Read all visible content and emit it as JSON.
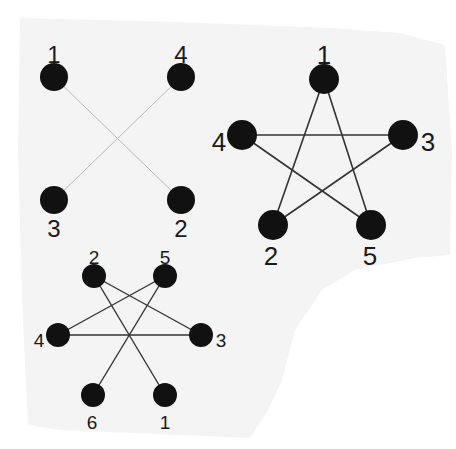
{
  "colors": {
    "background": "#ffffff",
    "paper": "#f4f4f4",
    "node": "#111111",
    "edge_dark": "#333333",
    "edge_light": "#b9b9b9",
    "label": "#1a1a1a"
  },
  "graphs": [
    {
      "id": "graph-a",
      "description": "4-node graph with crossing edges",
      "node_radius": 14,
      "label_size": 24,
      "edge_color_key": "edge_light",
      "edge_width": 1,
      "nodes": [
        {
          "id": "1",
          "label": "1",
          "x": 54,
          "y": 77,
          "lx": 54,
          "ly": 57
        },
        {
          "id": "4",
          "label": "4",
          "x": 181,
          "y": 77,
          "lx": 181,
          "ly": 57
        },
        {
          "id": "3",
          "label": "3",
          "x": 54,
          "y": 200,
          "lx": 54,
          "ly": 231
        },
        {
          "id": "2",
          "label": "2",
          "x": 181,
          "y": 200,
          "lx": 181,
          "ly": 231
        }
      ],
      "edges": [
        [
          "1",
          "2"
        ],
        [
          "4",
          "3"
        ]
      ]
    },
    {
      "id": "graph-b",
      "description": "5-node pentagram (star) graph",
      "node_radius": 15,
      "label_size": 26,
      "edge_color_key": "edge_dark",
      "edge_width": 1.6,
      "nodes": [
        {
          "id": "1",
          "label": "1",
          "x": 324,
          "y": 79,
          "lx": 324,
          "ly": 57
        },
        {
          "id": "4",
          "label": "4",
          "x": 242,
          "y": 135,
          "lx": 219,
          "ly": 144
        },
        {
          "id": "3",
          "label": "3",
          "x": 403,
          "y": 135,
          "lx": 428,
          "ly": 144
        },
        {
          "id": "2",
          "label": "2",
          "x": 273,
          "y": 225,
          "lx": 271,
          "ly": 258
        },
        {
          "id": "5",
          "label": "5",
          "x": 371,
          "y": 225,
          "lx": 370,
          "ly": 258
        }
      ],
      "edges": [
        [
          "1",
          "2"
        ],
        [
          "1",
          "5"
        ],
        [
          "4",
          "3"
        ],
        [
          "4",
          "5"
        ],
        [
          "3",
          "2"
        ]
      ]
    },
    {
      "id": "graph-c",
      "description": "6-node graph",
      "node_radius": 12,
      "label_size": 19,
      "edge_color_key": "edge_dark",
      "edge_width": 1.4,
      "nodes": [
        {
          "id": "2",
          "label": "2",
          "x": 94,
          "y": 276,
          "lx": 94,
          "ly": 259
        },
        {
          "id": "5",
          "label": "5",
          "x": 165,
          "y": 276,
          "lx": 165,
          "ly": 259
        },
        {
          "id": "4",
          "label": "4",
          "x": 58,
          "y": 335,
          "lx": 39,
          "ly": 342
        },
        {
          "id": "3",
          "label": "3",
          "x": 201,
          "y": 335,
          "lx": 221,
          "ly": 342
        },
        {
          "id": "6",
          "label": "6",
          "x": 93,
          "y": 395,
          "lx": 92,
          "ly": 424
        },
        {
          "id": "1",
          "label": "1",
          "x": 165,
          "y": 395,
          "lx": 165,
          "ly": 424
        }
      ],
      "edges": [
        [
          "2",
          "3"
        ],
        [
          "2",
          "1"
        ],
        [
          "5",
          "4"
        ],
        [
          "5",
          "6"
        ],
        [
          "4",
          "3"
        ]
      ]
    }
  ]
}
